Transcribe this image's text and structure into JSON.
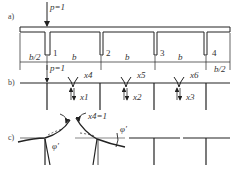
{
  "figure": {
    "panels": [
      {
        "id": "a",
        "label": "a)"
      },
      {
        "id": "b",
        "label": "b)"
      },
      {
        "id": "c",
        "label": "c)"
      }
    ],
    "panel_a": {
      "load_label": "p=1",
      "girders": [
        "1",
        "2",
        "3",
        "4"
      ],
      "dimensions": [
        "b/2",
        "b",
        "b",
        "b",
        "b/2"
      ]
    },
    "panel_b": {
      "load_label": "p=1",
      "moment_labels": [
        "x4",
        "x5",
        "x6"
      ],
      "shear_labels": [
        "x1",
        "x2",
        "x3"
      ]
    },
    "panel_c": {
      "unit_label": "x4=1",
      "rotation_labels": [
        "φ'",
        "φ'"
      ]
    },
    "colors": {
      "line": "#222222",
      "text": "#333333",
      "background": "#ffffff"
    }
  }
}
